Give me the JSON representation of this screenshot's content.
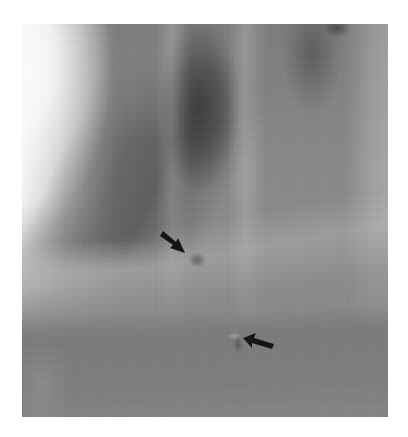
{
  "image": {
    "type": "radiograph",
    "tone": "grayscale",
    "frame": {
      "x": 22,
      "y": 24,
      "width": 366,
      "height": 393
    },
    "background_color": "#ffffff"
  },
  "annotations": [
    {
      "kind": "arrow",
      "direction": "down-right",
      "tail": [
        160,
        234
      ],
      "tip": [
        184,
        252
      ],
      "color": "#111111"
    },
    {
      "kind": "arrow",
      "direction": "left",
      "tail": [
        273,
        347
      ],
      "tip": [
        243,
        338
      ],
      "color": "#111111"
    }
  ]
}
